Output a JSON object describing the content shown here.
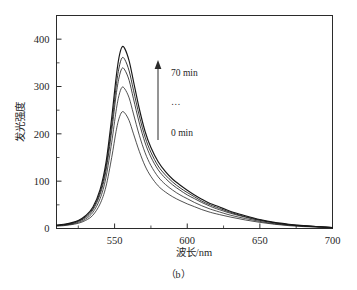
{
  "figure": {
    "caption": "（b）",
    "background_color": "#ffffff",
    "line_color": "#171717"
  },
  "annotations": {
    "top_label": "70 min",
    "middle_label": "…",
    "bottom_label": "0 min",
    "arrow_name": "upward-trend-arrow"
  },
  "chart_data": {
    "type": "line",
    "title": "",
    "xlabel": "波长/nm",
    "ylabel": "发光强度",
    "xlim": [
      510,
      700
    ],
    "ylim": [
      0,
      450
    ],
    "xticks": [
      550,
      600,
      650,
      700
    ],
    "xtick_labels": [
      "550",
      "600",
      "650",
      "700"
    ],
    "xminor_ticks": [
      525,
      575,
      625,
      675
    ],
    "yticks": [
      0,
      100,
      200,
      300,
      400
    ],
    "ytick_labels": [
      "0",
      "100",
      "200",
      "300",
      "400"
    ],
    "yminor_ticks": [
      50,
      150,
      250,
      350,
      450
    ],
    "grid": false,
    "legend_position": "none",
    "peak_wavelength_nm": 555,
    "series": [
      {
        "name": "0 min",
        "peak_value": 248,
        "x": [
          510,
          515,
          520,
          525,
          530,
          535,
          540,
          544,
          548,
          551,
          553,
          555,
          557,
          560,
          563,
          567,
          571,
          575,
          580,
          585,
          590,
          595,
          600,
          605,
          610,
          615,
          620,
          630,
          640,
          650,
          660,
          670,
          680,
          690,
          700
        ],
        "values": [
          5,
          6,
          8,
          11,
          17,
          28,
          52,
          88,
          150,
          205,
          232,
          246,
          244,
          228,
          200,
          163,
          132,
          110,
          90,
          77,
          67,
          59,
          52,
          46,
          40,
          35,
          31,
          24,
          18,
          13,
          9,
          6,
          4,
          3,
          2
        ]
      },
      {
        "name": "intermediate-1",
        "peak_value": 300,
        "x": [
          510,
          515,
          520,
          525,
          530,
          535,
          540,
          544,
          548,
          551,
          553,
          555,
          557,
          560,
          563,
          567,
          571,
          575,
          580,
          585,
          590,
          595,
          600,
          605,
          610,
          615,
          620,
          630,
          640,
          650,
          660,
          670,
          680,
          690,
          700
        ],
        "values": [
          6,
          7,
          9,
          13,
          20,
          34,
          63,
          107,
          182,
          248,
          281,
          298,
          295,
          276,
          242,
          197,
          160,
          133,
          109,
          93,
          81,
          71,
          63,
          55,
          48,
          42,
          37,
          28,
          21,
          15,
          10,
          7,
          5,
          3,
          2
        ]
      },
      {
        "name": "intermediate-2",
        "peak_value": 340,
        "x": [
          510,
          515,
          520,
          525,
          530,
          535,
          540,
          544,
          548,
          551,
          553,
          555,
          557,
          560,
          563,
          567,
          571,
          575,
          580,
          585,
          590,
          595,
          600,
          605,
          610,
          615,
          620,
          630,
          640,
          650,
          660,
          670,
          680,
          690,
          700
        ],
        "values": [
          6,
          8,
          10,
          15,
          23,
          39,
          72,
          121,
          206,
          281,
          318,
          338,
          335,
          313,
          274,
          223,
          181,
          151,
          124,
          106,
          92,
          81,
          71,
          63,
          55,
          48,
          42,
          32,
          24,
          17,
          12,
          8,
          5,
          4,
          2
        ]
      },
      {
        "name": "intermediate-3",
        "peak_value": 362,
        "x": [
          510,
          515,
          520,
          525,
          530,
          535,
          540,
          544,
          548,
          551,
          553,
          555,
          557,
          560,
          563,
          567,
          571,
          575,
          580,
          585,
          590,
          595,
          600,
          605,
          610,
          615,
          620,
          630,
          640,
          650,
          660,
          670,
          680,
          690,
          700
        ],
        "values": [
          7,
          8,
          11,
          16,
          25,
          42,
          77,
          129,
          219,
          299,
          339,
          360,
          357,
          333,
          292,
          238,
          193,
          161,
          132,
          113,
          98,
          86,
          76,
          67,
          58,
          51,
          45,
          34,
          25,
          18,
          12,
          8,
          6,
          4,
          2
        ]
      },
      {
        "name": "70 min",
        "peak_value": 385,
        "x": [
          510,
          515,
          520,
          525,
          530,
          535,
          540,
          544,
          548,
          551,
          553,
          555,
          557,
          560,
          563,
          567,
          571,
          575,
          580,
          585,
          590,
          595,
          600,
          605,
          610,
          615,
          620,
          630,
          640,
          650,
          660,
          670,
          680,
          690,
          700
        ],
        "values": [
          7,
          9,
          12,
          17,
          27,
          45,
          82,
          138,
          234,
          318,
          361,
          383,
          380,
          354,
          311,
          253,
          205,
          171,
          141,
          120,
          104,
          92,
          81,
          71,
          62,
          54,
          48,
          36,
          27,
          19,
          13,
          9,
          6,
          4,
          2
        ]
      }
    ]
  }
}
